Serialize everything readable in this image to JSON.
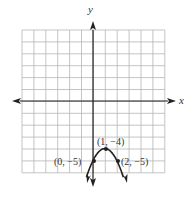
{
  "chart_data": {
    "type": "line",
    "title": "",
    "xlabel": "x",
    "ylabel": "y",
    "grid": true,
    "xlim": [
      -6,
      6
    ],
    "ylim": [
      -6,
      6
    ],
    "curve": "parabola opening downward, vertex (1, -4)",
    "equation": "y = -(x - 1)^2 - 4",
    "points": [
      {
        "x": 0,
        "y": -5,
        "label": "(0, −5)"
      },
      {
        "x": 1,
        "y": -4,
        "label": "(1, −4)"
      },
      {
        "x": 2,
        "y": -5,
        "label": "(2, −5)"
      }
    ]
  },
  "axes": {
    "x_label": "x",
    "y_label": "y"
  },
  "colors": {
    "grid": "#b5b5b5",
    "axis": "#222222",
    "curve": "#222222"
  }
}
